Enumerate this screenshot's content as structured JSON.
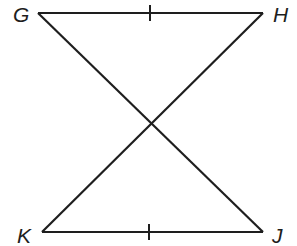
{
  "diagram": {
    "type": "geometry-figure",
    "vertices": {
      "G": {
        "label": "G",
        "x": 38,
        "y": 13
      },
      "H": {
        "label": "H",
        "x": 263,
        "y": 13
      },
      "K": {
        "label": "K",
        "x": 42,
        "y": 232
      },
      "J": {
        "label": "J",
        "x": 263,
        "y": 232
      }
    },
    "segments": [
      {
        "name": "GH",
        "from": "G",
        "to": "H",
        "tick_marks": 1
      },
      {
        "name": "KJ",
        "from": "K",
        "to": "J",
        "tick_marks": 1
      },
      {
        "name": "GJ",
        "from": "G",
        "to": "J",
        "tick_marks": 0
      },
      {
        "name": "HK",
        "from": "H",
        "to": "K",
        "tick_marks": 0
      }
    ],
    "congruence_marks": [
      "GH ≅ KJ"
    ],
    "colors": {
      "stroke": "#1e1e1e",
      "background": "#ffffff"
    }
  }
}
